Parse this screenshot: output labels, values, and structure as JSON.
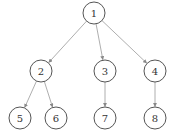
{
  "diagram": {
    "type": "tree",
    "nodes": [
      {
        "id": "1",
        "label": "1",
        "x": 94,
        "y": 13
      },
      {
        "id": "2",
        "label": "2",
        "x": 41,
        "y": 71
      },
      {
        "id": "3",
        "label": "3",
        "x": 105,
        "y": 71
      },
      {
        "id": "4",
        "label": "4",
        "x": 155,
        "y": 71
      },
      {
        "id": "5",
        "label": "5",
        "x": 20,
        "y": 118
      },
      {
        "id": "6",
        "label": "6",
        "x": 56,
        "y": 118
      },
      {
        "id": "7",
        "label": "7",
        "x": 105,
        "y": 118
      },
      {
        "id": "8",
        "label": "8",
        "x": 155,
        "y": 118
      }
    ],
    "edges": [
      {
        "from": "1",
        "to": "2"
      },
      {
        "from": "1",
        "to": "3"
      },
      {
        "from": "1",
        "to": "4"
      },
      {
        "from": "2",
        "to": "5"
      },
      {
        "from": "2",
        "to": "6"
      },
      {
        "from": "3",
        "to": "7"
      },
      {
        "from": "4",
        "to": "8"
      }
    ],
    "node_radius": 11,
    "colors": {
      "node_stroke": "#555555",
      "edge": "#999999",
      "label": "#333333"
    }
  }
}
